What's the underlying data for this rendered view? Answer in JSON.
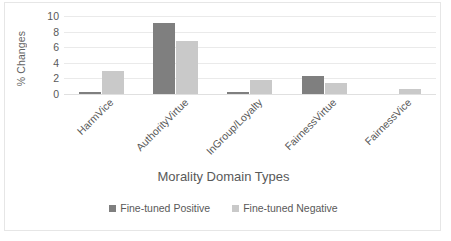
{
  "chart_data": {
    "type": "bar",
    "title": "",
    "xlabel": "Morality Domain Types",
    "ylabel": "% Changes",
    "categories": [
      "HarmVice",
      "AuthorityVirtue",
      "InGroup/Loyalty",
      "FairnessVirtue",
      "FairnessVice"
    ],
    "series": [
      {
        "name": "Fine-tuned Positive",
        "color": "#7f7f7f",
        "values": [
          0.2,
          9.1,
          0.25,
          2.3,
          0
        ]
      },
      {
        "name": "Fine-tuned Negative",
        "color": "#c9c9c9",
        "values": [
          3.0,
          6.8,
          1.8,
          1.35,
          0.65
        ]
      }
    ],
    "ylim": [
      0,
      10
    ],
    "yticks": [
      0,
      2,
      4,
      6,
      8,
      10
    ],
    "ytick_labels": [
      "0",
      "2",
      "4",
      "6",
      "8",
      "10"
    ],
    "grid": true,
    "legend_position": "bottom",
    "gridline_color": "#eaeaea",
    "axis_text_color": "#595959",
    "plot_background": "#ffffff",
    "border_color": "#e6e6e6"
  }
}
